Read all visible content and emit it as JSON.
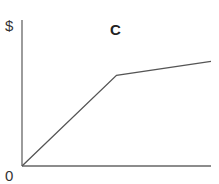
{
  "chart_data": {
    "type": "line",
    "title": "C",
    "ylabel": "$",
    "xlabel": "",
    "origin_label": "0",
    "grid": false,
    "legend": null,
    "series": [
      {
        "name": "C",
        "x": [
          0,
          0.5,
          1.0
        ],
        "y": [
          0,
          0.65,
          0.75
        ]
      }
    ],
    "xlim": [
      0,
      1
    ],
    "ylim": [
      0,
      1
    ],
    "colors": {
      "axis": "#666666",
      "line": "#555555"
    }
  }
}
